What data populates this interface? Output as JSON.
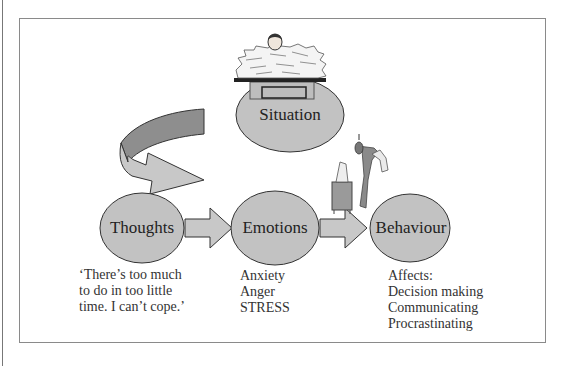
{
  "diagram": {
    "nodes": {
      "situation": {
        "label": "Situation"
      },
      "thoughts": {
        "label": "Thoughts"
      },
      "emotions": {
        "label": "Emotions"
      },
      "behaviour": {
        "label": "Behaviour"
      }
    },
    "captions": {
      "thoughts": "‘There’s too much\nto do in too little\ntime. I can’t cope.’",
      "emotions": "Anxiety\nAnger\nSTRESS",
      "behaviour": "Affects:\nDecision making\nCommunicating\nProcrastinating"
    },
    "colors": {
      "node_fill": "#c2c2c2",
      "node_stroke": "#333333",
      "arrow_fill": "#c8c8c8",
      "curved_arrow_dark": "#8e8e8e",
      "frame_border": "#8a8a8a"
    }
  }
}
